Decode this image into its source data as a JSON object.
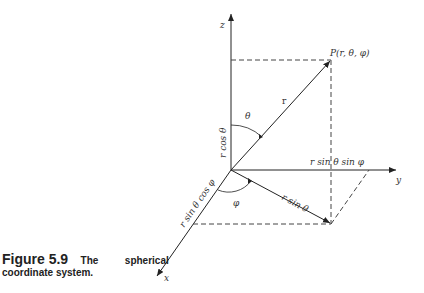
{
  "figure": {
    "number": "Figure 5.9",
    "caption_line1_word1": "The",
    "caption_line1_word2": "spherical",
    "caption_line2": "coordinate system."
  },
  "axes": {
    "z": "z",
    "y": "y",
    "x": "x"
  },
  "labels": {
    "point": "P(r, θ, φ)",
    "r": "r",
    "theta": "θ",
    "phi": "φ",
    "r_cos_theta": "r cos θ",
    "r_sin_theta": "r sin θ",
    "r_sin_theta_sin_phi": "r sin θ sin φ",
    "r_sin_theta_cos_phi": "r sin θ cos φ"
  },
  "colors": {
    "line": "#222222",
    "dash": "#444444"
  }
}
